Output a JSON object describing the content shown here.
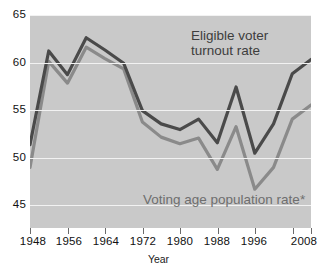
{
  "chart_data": {
    "type": "line",
    "title": "",
    "xlabel": "Year",
    "ylabel": "",
    "xlim": [
      1948,
      2008
    ],
    "ylim": [
      44.0,
      66.5
    ],
    "grid": true,
    "grid_axis": "y",
    "legend_position": "inline-annotations",
    "background": "#c9c9c9",
    "y_ticks": [
      45,
      50,
      55,
      60,
      65
    ],
    "x_ticks": [
      1948,
      1956,
      1964,
      1972,
      1980,
      1988,
      1996,
      2004,
      2008
    ],
    "x_tick_labels": [
      "1948",
      "1956",
      "1964",
      "1972",
      "1980",
      "1988",
      "1996",
      "",
      "2008"
    ],
    "x": [
      1948,
      1952,
      1956,
      1960,
      1964,
      1968,
      1972,
      1976,
      1980,
      1984,
      1988,
      1992,
      1996,
      2000,
      2004,
      2008
    ],
    "series": [
      {
        "name": "Eligible voter turnout rate",
        "color": "#4a4a4a",
        "values": [
          52.8,
          62.7,
          60.2,
          64.1,
          62.8,
          61.4,
          56.4,
          55.0,
          54.4,
          55.5,
          53.0,
          58.9,
          51.9,
          55.0,
          60.3,
          61.8
        ]
      },
      {
        "name": "Voting age population rate*",
        "color": "#8a8a8a",
        "values": [
          50.4,
          61.6,
          59.3,
          63.1,
          61.9,
          60.8,
          55.2,
          53.6,
          52.9,
          53.5,
          50.2,
          54.7,
          48.1,
          50.4,
          55.5,
          57.0
        ]
      }
    ],
    "annotations": [
      {
        "text": "Eligible voter turnout rate",
        "series": "Eligible voter turnout rate",
        "color": "#3d3d3d"
      },
      {
        "text": "Voting age population rate*",
        "series": "Voting age population rate*",
        "color": "#6e6e6e"
      }
    ]
  },
  "axes": {
    "y_labels": [
      "65",
      "60",
      "55",
      "50",
      "45"
    ],
    "x_labels": [
      "1948",
      "1956",
      "1964",
      "1972",
      "1980",
      "1988",
      "1996",
      "2008"
    ],
    "x_title": "Year"
  },
  "labels": {
    "eligible_line1": "Eligible voter",
    "eligible_line2": "turnout rate",
    "vap": "Voting age population rate*"
  }
}
